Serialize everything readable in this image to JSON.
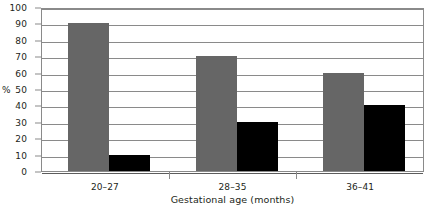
{
  "chart_data": {
    "type": "bar",
    "title": "",
    "subtitle": "",
    "xlabel": "Gestational age (months)",
    "ylabel": "%",
    "categories": [
      "20–27",
      "28–35",
      "36–41"
    ],
    "series": [
      {
        "name": "series-a",
        "color": "#666666",
        "values": [
          90,
          70,
          60
        ]
      },
      {
        "name": "series-b",
        "color": "#000000",
        "values": [
          10,
          30,
          40
        ]
      }
    ],
    "ylim": [
      0,
      100
    ],
    "ytick_step": 10,
    "yticks": [
      0,
      10,
      20,
      30,
      40,
      50,
      60,
      70,
      80,
      90,
      100
    ],
    "ytick_labels": [
      "0",
      "10",
      "20",
      "30",
      "40",
      "50",
      "60",
      "70",
      "80",
      "90",
      "100"
    ],
    "grid": "horizontal",
    "legend": "none",
    "legend_position": "",
    "annotations": [],
    "plot_border": true,
    "gridline_color": "#8a8a8a",
    "background_color": "#ffffff",
    "text_color": "#231f20"
  }
}
